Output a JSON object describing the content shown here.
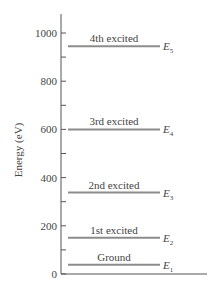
{
  "diagram": {
    "type": "energy-level-diagram",
    "ylabel": "Energy (eV)",
    "ylim": [
      0,
      1050
    ],
    "major_ticks": [
      0,
      200,
      400,
      600,
      800,
      1000
    ],
    "minor_ticks": [
      100,
      300,
      500,
      700,
      900
    ],
    "colors": {
      "axis": "#555555",
      "level": "#8c8c8c",
      "text": "#444444"
    },
    "levels": [
      {
        "name": "Ground",
        "symbol": "E",
        "sub": "1",
        "energy": 38
      },
      {
        "name": "1st excited",
        "symbol": "E",
        "sub": "2",
        "energy": 150
      },
      {
        "name": "2nd excited",
        "symbol": "E",
        "sub": "3",
        "energy": 338
      },
      {
        "name": "3rd excited",
        "symbol": "E",
        "sub": "4",
        "energy": 600
      },
      {
        "name": "4th excited",
        "symbol": "E",
        "sub": "5",
        "energy": 945
      }
    ]
  }
}
